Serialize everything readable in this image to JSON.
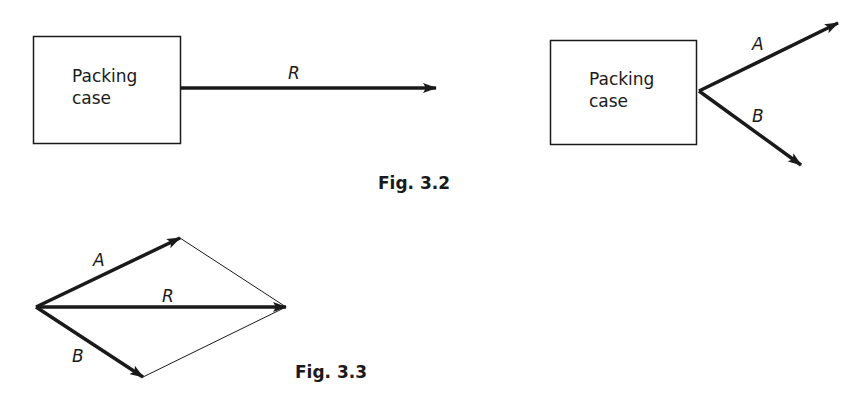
{
  "figures": [
    {
      "caption": "Fig. 3.2",
      "panels": [
        {
          "box_label_line1": "Packing",
          "box_label_line2": "case",
          "vectors": [
            {
              "label": "R",
              "direction": "horizontal-right"
            }
          ]
        },
        {
          "box_label_line1": "Packing",
          "box_label_line2": "case",
          "vectors": [
            {
              "label": "A",
              "direction": "up-right"
            },
            {
              "label": "B",
              "direction": "down-right"
            }
          ]
        }
      ]
    },
    {
      "caption": "Fig. 3.3",
      "description": "Parallelogram of forces: A + B = R",
      "vectors": [
        {
          "label": "A"
        },
        {
          "label": "R"
        },
        {
          "label": "B"
        }
      ]
    }
  ],
  "colors": {
    "ink": "#1a1a1a",
    "background": "#ffffff"
  }
}
